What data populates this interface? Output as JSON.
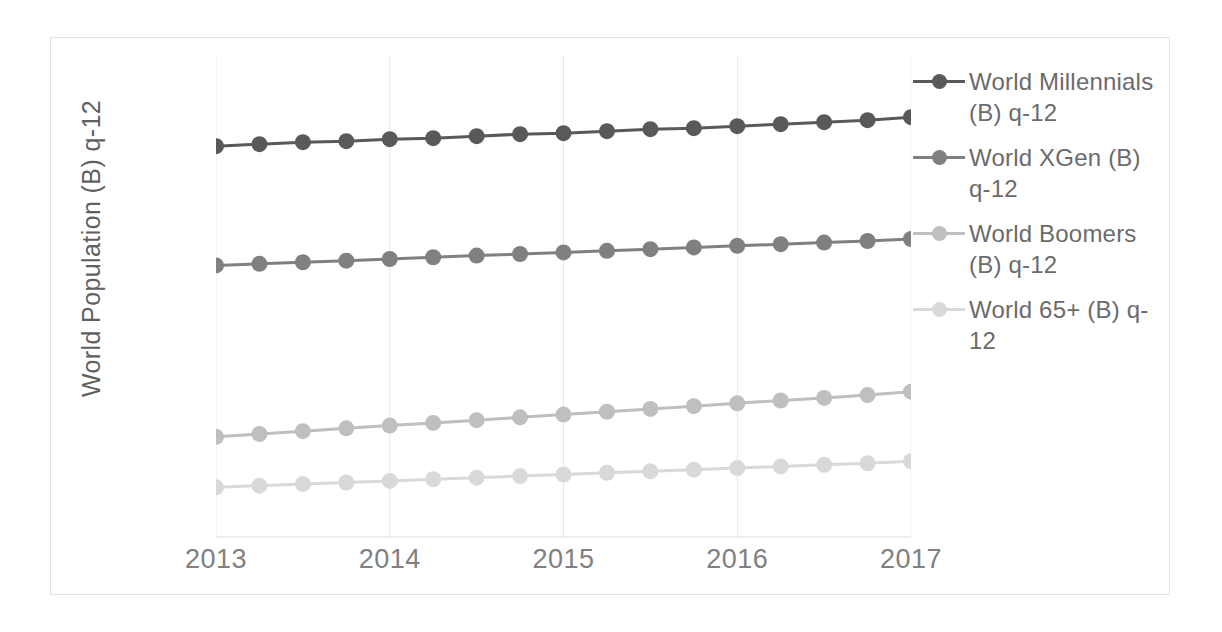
{
  "chart_data": {
    "type": "line",
    "title": "",
    "xlabel": "",
    "ylabel": "World Population (B) q-12",
    "xlim": [
      2013,
      2017
    ],
    "ylim": [
      0,
      2.4
    ],
    "grid": "vertical-only",
    "legend_position": "right",
    "x_tick_labels": [
      "2013",
      "2014",
      "2015",
      "2016",
      "2017"
    ],
    "x": [
      2013,
      2013.25,
      2013.5,
      2013.75,
      2014,
      2014.25,
      2014.5,
      2014.75,
      2015,
      2015.25,
      2015.5,
      2015.75,
      2016,
      2016.25,
      2016.5,
      2016.75,
      2017
    ],
    "series": [
      {
        "name": "World Millennials (B) q-12",
        "color": "#595959",
        "values": [
          1.95,
          1.96,
          1.97,
          1.975,
          1.985,
          1.99,
          2.0,
          2.01,
          2.015,
          2.025,
          2.035,
          2.04,
          2.05,
          2.06,
          2.07,
          2.08,
          2.095
        ]
      },
      {
        "name": "World XGen (B) q-12",
        "color": "#808080",
        "values": [
          1.355,
          1.363,
          1.371,
          1.379,
          1.387,
          1.396,
          1.404,
          1.412,
          1.42,
          1.428,
          1.436,
          1.445,
          1.453,
          1.461,
          1.469,
          1.477,
          1.487
        ]
      },
      {
        "name": "World Boomers (B) q-12",
        "color": "#bfbfbf",
        "values": [
          0.5,
          0.514,
          0.528,
          0.542,
          0.556,
          0.569,
          0.583,
          0.597,
          0.611,
          0.625,
          0.639,
          0.653,
          0.667,
          0.681,
          0.694,
          0.708,
          0.725
        ]
      },
      {
        "name": "World 65+ (B) q-12",
        "color": "#d9d9d9",
        "values": [
          0.248,
          0.256,
          0.264,
          0.272,
          0.28,
          0.288,
          0.296,
          0.304,
          0.312,
          0.32,
          0.328,
          0.336,
          0.344,
          0.352,
          0.36,
          0.368,
          0.378
        ]
      }
    ]
  },
  "legend": {
    "items": [
      {
        "label": "World Millennials (B) q-12",
        "color": "#595959"
      },
      {
        "label": "World XGen (B) q-12",
        "color": "#808080"
      },
      {
        "label": "World Boomers (B) q-12",
        "color": "#bfbfbf"
      },
      {
        "label": "World 65+ (B) q-12",
        "color": "#d9d9d9"
      }
    ]
  },
  "axis": {
    "y_title": "World Population (B) q-12"
  }
}
